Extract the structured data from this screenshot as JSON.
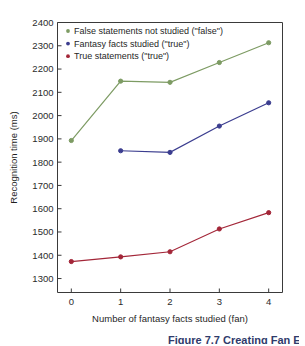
{
  "chart_data": {
    "type": "line",
    "title": "",
    "xlabel": "Number of fantasy facts studied (fan)",
    "ylabel": "Recognition time (ms)",
    "x": [
      0,
      1,
      2,
      3,
      4
    ],
    "xticklabels": [
      "0",
      "1",
      "2",
      "3",
      "4"
    ],
    "yticklabels": [
      "1300",
      "1400",
      "1500",
      "1600",
      "1700",
      "1800",
      "1900",
      "2000",
      "2100",
      "2200",
      "2300",
      "2400"
    ],
    "yticks": [
      1300,
      1400,
      1500,
      1600,
      1700,
      1800,
      1900,
      2000,
      2100,
      2200,
      2300,
      2400
    ],
    "xlim": [
      -0.28,
      4.28
    ],
    "ylim": [
      1240,
      2400
    ],
    "grid": false,
    "legend_position": "top-left inside",
    "series": [
      {
        "name": "False statements not studied (\"false\")",
        "color": "#7d9b63",
        "marker": "circle",
        "x": [
          0,
          1,
          2,
          3,
          4
        ],
        "values": [
          1893,
          2148,
          2143,
          2228,
          2313
        ]
      },
      {
        "name": "Fantasy facts studied (\"true\")",
        "color": "#3b3d8f",
        "marker": "circle",
        "x": [
          1,
          2,
          3,
          4
        ],
        "values": [
          1849,
          1842,
          1955,
          2055
        ]
      },
      {
        "name": "True statements (\"true\")",
        "color": "#a32638",
        "marker": "circle",
        "x": [
          0,
          1,
          2,
          3,
          4
        ],
        "values": [
          1373,
          1393,
          1415,
          1513,
          1583
        ]
      }
    ]
  },
  "caption": {
    "partial_text": "Figure 7.7  Creating Fan Effects"
  }
}
